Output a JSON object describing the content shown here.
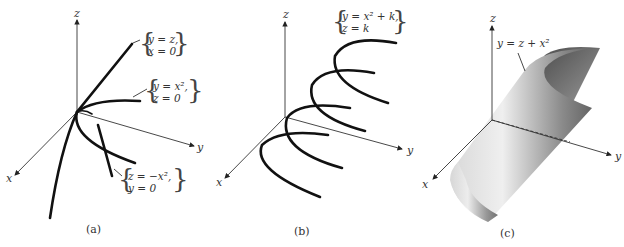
{
  "panels": [
    {
      "id": "a",
      "caption": "(a)",
      "axes": {
        "x": "x",
        "y": "y",
        "z": "z"
      },
      "curves": [
        {
          "line1": "y = z,",
          "line2": "x = 0"
        },
        {
          "line1": "y = x²,",
          "line2": "z = 0"
        },
        {
          "line1": "z = −x²,",
          "line2": "y = 0"
        }
      ]
    },
    {
      "id": "b",
      "caption": "(b)",
      "axes": {
        "x": "x",
        "y": "y",
        "z": "z"
      },
      "curves": [
        {
          "line1": "y = x² + k,",
          "line2": "z = k"
        }
      ]
    },
    {
      "id": "c",
      "caption": "(c)",
      "axes": {
        "x": "x",
        "y": "y",
        "z": "z"
      },
      "surface_label": "y = z + x²"
    }
  ]
}
